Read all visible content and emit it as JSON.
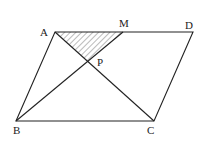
{
  "diagram": {
    "type": "geometry",
    "labels": {
      "A": "A",
      "B": "B",
      "C": "C",
      "D": "D",
      "M": "M",
      "P": "P"
    },
    "shaded_region": "triangle AMP"
  }
}
